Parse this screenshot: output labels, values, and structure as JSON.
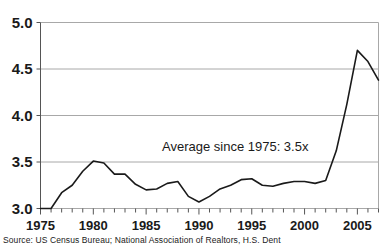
{
  "chart_data": {
    "type": "line",
    "title": "",
    "xlabel": "",
    "ylabel": "",
    "xlim": [
      1975,
      2007
    ],
    "ylim": [
      3.0,
      5.0
    ],
    "yticks": [
      "3.0",
      "3.5",
      "4.0",
      "4.5",
      "5.0"
    ],
    "ytick_values": [
      3.0,
      3.5,
      4.0,
      4.5,
      5.0
    ],
    "xticks": [
      "1975",
      "1980",
      "1985",
      "1990",
      "1995",
      "2000",
      "2005"
    ],
    "xtick_values": [
      1975,
      1980,
      1985,
      1990,
      1995,
      2000,
      2005
    ],
    "minor_xticks": true,
    "grid": "horizontal",
    "legend": "none",
    "annotations": [
      {
        "text": "Average since 1975: 3.5x",
        "x": 1986.5,
        "y": 3.62
      }
    ],
    "x": [
      1975,
      1976,
      1977,
      1978,
      1979,
      1980,
      1981,
      1982,
      1983,
      1984,
      1985,
      1986,
      1987,
      1988,
      1989,
      1990,
      1991,
      1992,
      1993,
      1994,
      1995,
      1996,
      1997,
      1998,
      1999,
      2000,
      2001,
      2002,
      2003,
      2004,
      2005,
      2006,
      2007
    ],
    "values": [
      3.0,
      3.0,
      3.17,
      3.25,
      3.4,
      3.51,
      3.49,
      3.37,
      3.37,
      3.26,
      3.2,
      3.21,
      3.27,
      3.29,
      3.13,
      3.07,
      3.13,
      3.21,
      3.25,
      3.31,
      3.32,
      3.25,
      3.24,
      3.27,
      3.29,
      3.29,
      3.27,
      3.3,
      3.62,
      4.12,
      4.7,
      4.58,
      4.38
    ],
    "series": [
      {
        "name": "Home price to income ratio",
        "values": [
          3.0,
          3.0,
          3.17,
          3.25,
          3.4,
          3.51,
          3.49,
          3.37,
          3.37,
          3.26,
          3.2,
          3.21,
          3.27,
          3.29,
          3.13,
          3.07,
          3.13,
          3.21,
          3.25,
          3.31,
          3.32,
          3.25,
          3.24,
          3.27,
          3.29,
          3.29,
          3.27,
          3.3,
          3.62,
          4.12,
          4.7,
          4.58,
          4.38
        ],
        "color": "#1a1a1a"
      }
    ],
    "colors": {
      "line": "#1a1a1a",
      "grid": "#a8a8a8",
      "axis": "#555555",
      "text": "#1a1a1a",
      "background": "#ffffff"
    }
  },
  "source": {
    "text": "Source: US Census Bureau; National Association of Realtors, H.S. Dent"
  }
}
